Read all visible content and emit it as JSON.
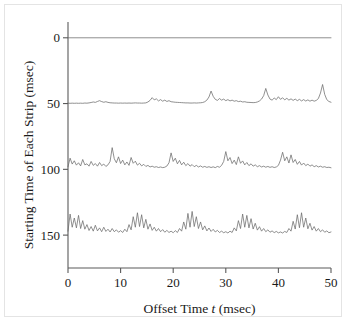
{
  "figure": {
    "background_color": "#ffffff",
    "line_color": "#6b6b6b",
    "axis_color": "#5a5a5a",
    "text_color": "#1a1a1a"
  },
  "axes": {
    "x_title_prefix": "Offset Time ",
    "x_title_italic": "t",
    "x_title_suffix": " (msec)",
    "y_title": "Starting Time of Each Strip (msec)",
    "x_tick_labels": [
      "0",
      "10",
      "20",
      "30",
      "40",
      "50"
    ],
    "y_tick_labels": [
      "0",
      "50",
      "100",
      "150"
    ]
  },
  "chart_data": {
    "type": "line",
    "title": "",
    "xlabel": "Offset Time t (msec)",
    "ylabel": "Starting Time of Each Strip (msec)",
    "xlim": [
      0,
      50
    ],
    "ylim": [
      175,
      -12
    ],
    "y_inverted": true,
    "grid": false,
    "legend": "none",
    "x_ticks": [
      0,
      10,
      20,
      30,
      40,
      50
    ],
    "y_ticks": [
      0,
      50,
      100,
      150
    ],
    "series": [
      {
        "name": "strip-0msec",
        "baseline": 0,
        "amplitude_scale": 1.0,
        "x": [
          0,
          50
        ],
        "values": [
          0,
          0
        ],
        "note": "flat line, no measurable correlation structure"
      },
      {
        "name": "strip-50msec",
        "baseline": 50,
        "amplitude_scale": 1.0,
        "x": [
          0.0,
          0.4,
          0.8,
          1.2,
          1.6,
          2.0,
          2.4,
          2.8,
          3.2,
          3.6,
          4.0,
          4.4,
          4.8,
          5.2,
          5.6,
          6.0,
          6.4,
          6.8,
          7.2,
          7.6,
          8.0,
          8.4,
          8.8,
          9.2,
          9.6,
          10.0,
          10.4,
          10.8,
          11.2,
          11.6,
          12.0,
          12.4,
          12.8,
          13.2,
          13.6,
          14.0,
          14.4,
          14.8,
          15.2,
          15.6,
          16.0,
          16.4,
          16.8,
          17.2,
          17.6,
          18.0,
          18.4,
          18.8,
          19.2,
          19.6,
          20.0,
          20.4,
          20.8,
          21.2,
          21.6,
          22.0,
          22.4,
          22.8,
          23.2,
          23.6,
          24.0,
          24.4,
          24.8,
          25.2,
          25.6,
          26.0,
          26.4,
          26.8,
          27.2,
          27.6,
          28.0,
          28.4,
          28.8,
          29.2,
          29.6,
          30.0,
          30.4,
          30.8,
          31.2,
          31.6,
          32.0,
          32.4,
          32.8,
          33.2,
          33.6,
          34.0,
          34.4,
          34.8,
          35.2,
          35.6,
          36.0,
          36.4,
          36.8,
          37.2,
          37.6,
          38.0,
          38.4,
          38.8,
          39.2,
          39.6,
          40.0,
          40.4,
          40.8,
          41.2,
          41.6,
          42.0,
          42.4,
          42.8,
          43.2,
          43.6,
          44.0,
          44.4,
          44.8,
          45.2,
          45.6,
          46.0,
          46.4,
          46.8,
          47.2,
          47.6,
          48.0,
          48.4,
          48.8,
          49.2,
          49.6,
          50.0
        ],
        "values": [
          0.3,
          0.2,
          0.3,
          0.2,
          0.3,
          0.2,
          0.3,
          0.2,
          0.4,
          0.3,
          0.5,
          0.8,
          1.2,
          0.9,
          1.6,
          2.2,
          1.5,
          1.0,
          1.4,
          0.9,
          0.6,
          0.5,
          0.4,
          0.4,
          0.3,
          0.4,
          0.3,
          0.4,
          0.3,
          0.4,
          0.3,
          0.4,
          0.5,
          0.4,
          0.4,
          0.3,
          0.4,
          0.5,
          1.2,
          2.4,
          4.5,
          2.8,
          3.6,
          2.0,
          3.0,
          1.8,
          2.6,
          1.6,
          2.2,
          1.4,
          1.2,
          1.0,
          0.9,
          0.8,
          0.7,
          0.6,
          0.5,
          0.5,
          0.4,
          0.4,
          0.5,
          0.4,
          0.5,
          0.6,
          0.8,
          1.4,
          2.6,
          5.0,
          9.5,
          5.5,
          3.2,
          2.4,
          3.8,
          2.6,
          3.4,
          2.2,
          3.0,
          2.0,
          2.6,
          1.8,
          2.2,
          1.5,
          1.8,
          1.2,
          1.4,
          1.0,
          0.9,
          0.8,
          0.7,
          0.8,
          1.2,
          2.0,
          3.4,
          6.0,
          11.5,
          6.5,
          3.4,
          2.6,
          4.2,
          3.0,
          5.2,
          3.2,
          4.4,
          2.8,
          4.0,
          2.6,
          3.6,
          2.4,
          3.4,
          2.2,
          3.2,
          2.0,
          3.0,
          1.9,
          2.8,
          1.8,
          2.6,
          1.8,
          2.4,
          3.8,
          8.0,
          14.5,
          7.0,
          3.0,
          1.6,
          1.0
        ]
      },
      {
        "name": "strip-100msec",
        "baseline": 100,
        "amplitude_scale": 1.0,
        "x": [
          0.0,
          0.4,
          0.8,
          1.2,
          1.6,
          2.0,
          2.4,
          2.8,
          3.2,
          3.6,
          4.0,
          4.4,
          4.8,
          5.2,
          5.6,
          6.0,
          6.4,
          6.8,
          7.2,
          7.6,
          8.0,
          8.4,
          8.8,
          9.2,
          9.6,
          10.0,
          10.4,
          10.8,
          11.2,
          11.6,
          12.0,
          12.4,
          12.8,
          13.2,
          13.6,
          14.0,
          14.4,
          14.8,
          15.2,
          15.6,
          16.0,
          16.4,
          16.8,
          17.2,
          17.6,
          18.0,
          18.4,
          18.8,
          19.2,
          19.6,
          20.0,
          20.4,
          20.8,
          21.2,
          21.6,
          22.0,
          22.4,
          22.8,
          23.2,
          23.6,
          24.0,
          24.4,
          24.8,
          25.2,
          25.6,
          26.0,
          26.4,
          26.8,
          27.2,
          27.6,
          28.0,
          28.4,
          28.8,
          29.2,
          29.6,
          30.0,
          30.4,
          30.8,
          31.2,
          31.6,
          32.0,
          32.4,
          32.8,
          33.2,
          33.6,
          34.0,
          34.4,
          34.8,
          35.2,
          35.6,
          36.0,
          36.4,
          36.8,
          37.2,
          37.6,
          38.0,
          38.4,
          38.8,
          39.2,
          39.6,
          40.0,
          40.4,
          40.8,
          41.2,
          41.6,
          42.0,
          42.4,
          42.8,
          43.2,
          43.6,
          44.0,
          44.4,
          44.8,
          45.2,
          45.6,
          46.0,
          46.4,
          46.8,
          47.2,
          47.6,
          48.0,
          48.4,
          48.8,
          49.2,
          49.6,
          50.0
        ],
        "values": [
          2.0,
          8.5,
          4.0,
          6.5,
          3.2,
          5.0,
          2.6,
          7.5,
          3.4,
          4.2,
          2.4,
          6.0,
          3.0,
          4.4,
          2.4,
          5.2,
          2.8,
          4.0,
          2.2,
          3.4,
          6.0,
          16.5,
          8.0,
          5.0,
          9.5,
          4.4,
          7.0,
          3.4,
          5.6,
          3.0,
          9.0,
          4.6,
          6.2,
          3.2,
          4.6,
          2.6,
          3.8,
          2.2,
          3.0,
          1.8,
          2.4,
          1.6,
          2.0,
          1.4,
          1.8,
          1.3,
          1.6,
          2.5,
          5.0,
          12.5,
          6.0,
          8.5,
          4.2,
          6.8,
          3.4,
          5.4,
          2.8,
          4.4,
          2.4,
          3.6,
          2.0,
          3.0,
          1.8,
          2.6,
          1.6,
          2.2,
          1.5,
          2.0,
          1.4,
          1.9,
          1.3,
          2.2,
          1.6,
          3.0,
          6.0,
          13.5,
          6.5,
          9.0,
          4.4,
          7.0,
          3.6,
          9.5,
          4.6,
          6.4,
          3.4,
          5.2,
          2.8,
          4.2,
          2.4,
          3.4,
          2.0,
          2.8,
          1.8,
          2.4,
          1.6,
          2.2,
          1.5,
          2.0,
          1.4,
          1.8,
          3.0,
          7.0,
          13.0,
          6.5,
          9.5,
          4.8,
          11.0,
          5.2,
          7.5,
          3.8,
          6.0,
          3.2,
          4.8,
          2.8,
          4.0,
          2.4,
          3.4,
          2.0,
          2.8,
          1.8,
          2.4,
          1.6,
          2.0,
          1.4,
          1.6,
          1.2
        ]
      },
      {
        "name": "strip-150msec",
        "baseline": 150,
        "amplitude_scale": 1.0,
        "x": [
          0.0,
          0.4,
          0.8,
          1.2,
          1.6,
          2.0,
          2.4,
          2.8,
          3.2,
          3.6,
          4.0,
          4.4,
          4.8,
          5.2,
          5.6,
          6.0,
          6.4,
          6.8,
          7.2,
          7.6,
          8.0,
          8.4,
          8.8,
          9.2,
          9.6,
          10.0,
          10.4,
          10.8,
          11.2,
          11.6,
          12.0,
          12.4,
          12.8,
          13.2,
          13.6,
          14.0,
          14.4,
          14.8,
          15.2,
          15.6,
          16.0,
          16.4,
          16.8,
          17.2,
          17.6,
          18.0,
          18.4,
          18.8,
          19.2,
          19.6,
          20.0,
          20.4,
          20.8,
          21.2,
          21.6,
          22.0,
          22.4,
          22.8,
          23.2,
          23.6,
          24.0,
          24.4,
          24.8,
          25.2,
          25.6,
          26.0,
          26.4,
          26.8,
          27.2,
          27.6,
          28.0,
          28.4,
          28.8,
          29.2,
          29.6,
          30.0,
          30.4,
          30.8,
          31.2,
          31.6,
          32.0,
          32.4,
          32.8,
          33.2,
          33.6,
          34.0,
          34.4,
          34.8,
          35.2,
          35.6,
          36.0,
          36.4,
          36.8,
          37.2,
          37.6,
          38.0,
          38.4,
          38.8,
          39.2,
          39.6,
          40.0,
          40.4,
          40.8,
          41.2,
          41.6,
          42.0,
          42.4,
          42.8,
          43.2,
          43.6,
          44.0,
          44.4,
          44.8,
          45.2,
          45.6,
          46.0,
          46.4,
          46.8,
          47.2,
          47.6,
          48.0,
          48.4,
          48.8,
          49.2,
          49.6,
          50.0
        ],
        "values": [
          3.0,
          16.0,
          6.0,
          13.0,
          5.5,
          15.0,
          5.0,
          11.0,
          4.5,
          8.0,
          3.5,
          6.5,
          3.0,
          7.5,
          3.2,
          5.5,
          2.6,
          6.0,
          2.8,
          4.5,
          2.4,
          5.0,
          2.6,
          4.0,
          2.2,
          3.4,
          2.0,
          4.5,
          2.6,
          8.0,
          4.0,
          14.0,
          6.0,
          17.0,
          6.5,
          15.5,
          5.5,
          12.0,
          4.5,
          8.5,
          3.6,
          6.0,
          3.0,
          5.0,
          2.6,
          4.2,
          2.2,
          3.6,
          2.0,
          3.0,
          1.8,
          3.4,
          2.0,
          5.0,
          3.0,
          10.0,
          4.5,
          16.5,
          6.0,
          18.0,
          6.5,
          14.0,
          5.0,
          10.0,
          4.0,
          7.0,
          3.2,
          5.4,
          2.8,
          4.4,
          2.4,
          3.6,
          2.0,
          3.0,
          1.8,
          2.6,
          1.6,
          3.0,
          2.0,
          5.5,
          3.2,
          11.0,
          5.0,
          16.0,
          6.0,
          15.0,
          5.5,
          12.5,
          4.6,
          9.0,
          3.8,
          6.4,
          3.0,
          5.0,
          2.6,
          4.0,
          2.2,
          3.2,
          1.9,
          2.8,
          1.7,
          2.4,
          1.6,
          2.8,
          2.0,
          5.0,
          3.0,
          10.5,
          4.6,
          15.5,
          5.6,
          17.0,
          6.0,
          13.0,
          4.8,
          9.0,
          3.8,
          6.5,
          3.0,
          5.0,
          2.6,
          4.0,
          2.2,
          3.2,
          1.8,
          2.4
        ]
      }
    ]
  }
}
